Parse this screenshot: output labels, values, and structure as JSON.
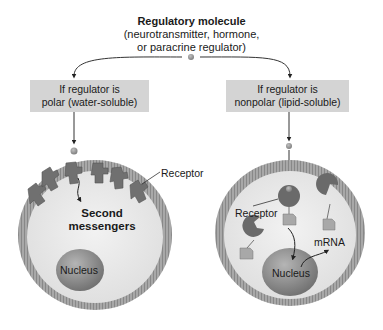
{
  "title": {
    "heading": "Regulatory molecule",
    "subtitle_line1": "(neurotransmitter, hormone,",
    "subtitle_line2": "or paracrine regulator)"
  },
  "branches": [
    {
      "condition_line1": "If regulator is",
      "condition_line2": "polar (water-soluble)",
      "labels": {
        "receptor": "Receptor",
        "second_messengers_line1": "Second",
        "second_messengers_line2": "messengers",
        "nucleus": "Nucleus"
      }
    },
    {
      "condition_line1": "If regulator is",
      "condition_line2": "nonpolar (lipid-soluble)",
      "labels": {
        "receptor": "Receptor",
        "mrna": "mRNA",
        "nucleus": "Nucleus"
      }
    }
  ],
  "colors": {
    "box_fill": "#d4d4d4",
    "membrane": "#9a9a9a",
    "cytoplasm": "#e6e6e6",
    "nucleus": "#8a8a8a",
    "receptor": "#6e6e6e",
    "molecule": "#8c8c8c"
  }
}
